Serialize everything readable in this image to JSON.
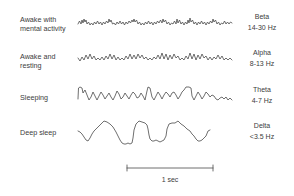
{
  "figure": {
    "rows": [
      {
        "state_line1": "Awake with",
        "state_line2": "mental activity",
        "band": "Beta",
        "range": "14-30 Hz"
      },
      {
        "state_line1": "Awake and",
        "state_line2": "resting",
        "band": "Alpha",
        "range": "8-13 Hz"
      },
      {
        "state_line1": "Sleeping",
        "state_line2": "",
        "band": "Theta",
        "range": "4-7 Hz"
      },
      {
        "state_line1": "Deep sleep",
        "state_line2": "",
        "band": "Delta",
        "range": "<3.5 Hz"
      }
    ],
    "scale_bar_label": "1 sec",
    "colors": {
      "trace": "#4a4a4a",
      "text": "#3c3c3c",
      "background": "#ffffff"
    }
  }
}
